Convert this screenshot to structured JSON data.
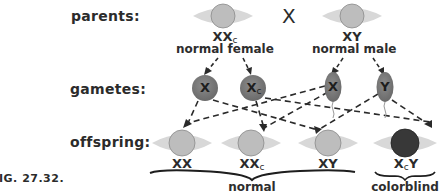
{
  "figure_label": "IG. 27.32.",
  "rows": {
    "parents": "parents:",
    "gametes": "gametes:",
    "offspring": "offspring:"
  },
  "cross_symbol": "X",
  "parents": [
    {
      "genotype": "XX",
      "subscript": "c",
      "description": "normal female",
      "eye_color": "#b8b8b8"
    },
    {
      "genotype": "XY",
      "subscript": "",
      "description": "normal male",
      "eye_color": "#b8b8b8"
    }
  ],
  "gametes": [
    {
      "label": "X",
      "subscript": "",
      "shape": "egg",
      "parent": "female"
    },
    {
      "label": "X",
      "subscript": "c",
      "shape": "egg",
      "parent": "female"
    },
    {
      "label": "X",
      "subscript": "",
      "shape": "sperm",
      "parent": "male"
    },
    {
      "label": "Y",
      "subscript": "",
      "shape": "sperm",
      "parent": "male"
    }
  ],
  "offspring": [
    {
      "genotype_main": "XX",
      "subscript": "",
      "tail": "",
      "phenotype": "normal"
    },
    {
      "genotype_main": "XX",
      "subscript": "c",
      "tail": "",
      "phenotype": "normal"
    },
    {
      "genotype_main": "XY",
      "subscript": "",
      "tail": "",
      "phenotype": "normal"
    },
    {
      "genotype_main": "X",
      "subscript": "c",
      "tail": "Y",
      "phenotype": "colorblind"
    }
  ],
  "groups": {
    "normal": "normal",
    "colorblind": "colorblind"
  },
  "colors": {
    "eye_white": "#d9d9d9",
    "iris_normal": "#bdbdbd",
    "iris_colorblind": "#3a3a3a",
    "gamete_fill": "#7a7a7a",
    "line": "#2a2a2a"
  }
}
